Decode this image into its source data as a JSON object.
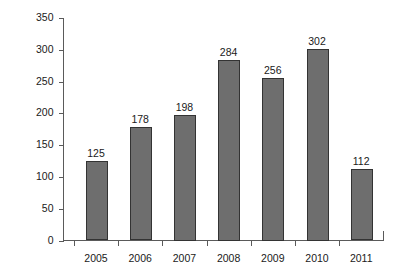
{
  "chart_data": {
    "type": "bar",
    "title": "",
    "subtitle": "",
    "xlabel": "",
    "ylabel": "",
    "categories": [
      "2005",
      "2006",
      "2007",
      "2008",
      "2009",
      "2010",
      "2011"
    ],
    "values": [
      125,
      178,
      198,
      284,
      256,
      302,
      112
    ],
    "value_labels": [
      "125",
      "178",
      "198",
      "284",
      "256",
      "302",
      "112"
    ],
    "ylim": [
      0,
      350
    ],
    "yticks": [
      0,
      50,
      100,
      150,
      200,
      250,
      300,
      350
    ],
    "ytick_labels": [
      "0",
      "50",
      "100",
      "150",
      "200",
      "250",
      "300",
      "350"
    ],
    "grid": false,
    "legend": false,
    "legend_position": "none",
    "annotations": [],
    "series": [
      {
        "name": "",
        "values": [
          125,
          178,
          198,
          284,
          256,
          302,
          112
        ]
      }
    ],
    "colors": {
      "bar_fill": "#6e6e6e",
      "bar_stroke": "#333333",
      "axis": "#5a5a5a",
      "text": "#1a1a1a",
      "background": "#ffffff"
    }
  }
}
